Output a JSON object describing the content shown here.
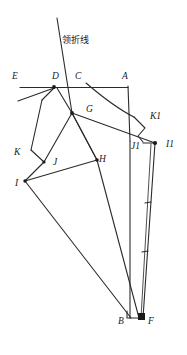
{
  "diagram": {
    "title_text": "领折线",
    "title_meaning": "collar-fold-line",
    "background_color": "#ffffff",
    "line_color": "#2b2b2b",
    "labels": [
      {
        "id": "E",
        "text": "E",
        "x": 12,
        "y": 79
      },
      {
        "id": "D",
        "text": "D",
        "x": 52,
        "y": 79
      },
      {
        "id": "C",
        "text": "C",
        "x": 75,
        "y": 79
      },
      {
        "id": "A",
        "text": "A",
        "x": 122,
        "y": 79
      },
      {
        "id": "G",
        "text": "G",
        "x": 86,
        "y": 112
      },
      {
        "id": "K1",
        "text": "K1",
        "x": 150,
        "y": 119
      },
      {
        "id": "J1",
        "text": "J1",
        "x": 131,
        "y": 149
      },
      {
        "id": "I1",
        "text": "I1",
        "x": 166,
        "y": 147
      },
      {
        "id": "K",
        "text": "K",
        "x": 14,
        "y": 155
      },
      {
        "id": "J",
        "text": "J",
        "x": 53,
        "y": 165
      },
      {
        "id": "H",
        "text": "H",
        "x": 99,
        "y": 162
      },
      {
        "id": "I",
        "text": "I",
        "x": 15,
        "y": 186
      },
      {
        "id": "B",
        "text": "B",
        "x": 118,
        "y": 324
      },
      {
        "id": "F",
        "text": "F",
        "x": 148,
        "y": 324
      }
    ],
    "fold_line_label": {
      "text": "领折线",
      "x": 62,
      "y": 43
    },
    "points": {
      "E": [
        20,
        86
      ],
      "D": [
        54,
        86
      ],
      "C": [
        72,
        86
      ],
      "A": [
        128,
        86
      ],
      "G": [
        72,
        113
      ],
      "K1": [
        145,
        128
      ],
      "J1": [
        130,
        141
      ],
      "I1": [
        155,
        143
      ],
      "K": [
        31,
        150
      ],
      "J": [
        44,
        162
      ],
      "H": [
        97,
        160
      ],
      "I": [
        25,
        181
      ],
      "B": [
        127,
        318
      ],
      "F": [
        143,
        318
      ]
    }
  }
}
